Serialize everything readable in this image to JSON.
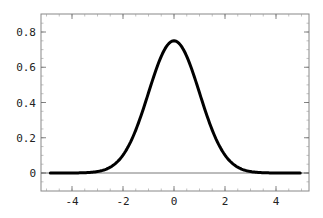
{
  "chart_data": {
    "type": "line",
    "title": "",
    "xlabel": "",
    "ylabel": "",
    "xlim": [
      -5,
      5
    ],
    "ylim": [
      -0.1,
      0.9
    ],
    "x_ticks": [
      -4,
      -2,
      0,
      2,
      4
    ],
    "x_tick_labels": [
      "-4",
      "-2",
      "0",
      "2",
      "4"
    ],
    "y_ticks": [
      0,
      0.2,
      0.4,
      0.6,
      0.8
    ],
    "y_tick_labels": [
      "0",
      "0.2",
      "0.4",
      "0.6",
      "0.8"
    ],
    "grid": false,
    "legend": null,
    "reference_lines": [
      {
        "axis": "y",
        "value": 0
      }
    ],
    "series": [
      {
        "name": "curve",
        "color": "#000000",
        "description": "Gaussian bell curve centered at 0, peak ~0.75, sigma ~1",
        "x": [
          -5,
          -4,
          -3,
          -2.5,
          -2,
          -1.5,
          -1,
          -0.5,
          0,
          0.5,
          1,
          1.5,
          2,
          2.5,
          3,
          4,
          5
        ],
        "y": [
          0.0,
          0.0,
          0.01,
          0.03,
          0.1,
          0.24,
          0.45,
          0.66,
          0.75,
          0.66,
          0.45,
          0.24,
          0.1,
          0.03,
          0.01,
          0.0,
          0.0
        ]
      }
    ]
  }
}
